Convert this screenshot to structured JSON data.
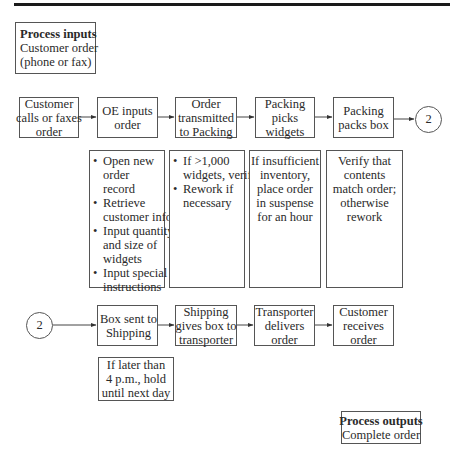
{
  "process_inputs": {
    "title": "Process inputs",
    "lines": [
      "Customer order",
      "(phone or fax)"
    ]
  },
  "top_row": [
    {
      "lines": [
        "Customer",
        "calls or faxes",
        "order"
      ]
    },
    {
      "lines": [
        "OE inputs",
        "order"
      ]
    },
    {
      "lines": [
        "Order",
        "transmitted",
        "to Packing"
      ]
    },
    {
      "lines": [
        "Packing",
        "picks",
        "widgets"
      ]
    },
    {
      "lines": [
        "Packing",
        "packs box"
      ]
    }
  ],
  "connector": {
    "label": "2"
  },
  "details": [
    {
      "bullets": [
        [
          "Open new",
          "order",
          "record"
        ],
        [
          "Retrieve",
          "customer info"
        ],
        [
          "Input quantity",
          "and size of",
          "widgets"
        ],
        [
          "Input special",
          "instructions"
        ]
      ]
    },
    {
      "bullets": [
        [
          "If >1,000",
          "widgets, verify"
        ],
        [
          "Rework if",
          "necessary"
        ]
      ]
    },
    {
      "lines": [
        "If insufficient",
        "inventory,",
        "place order",
        "in suspense",
        "for an hour"
      ]
    },
    {
      "lines": [
        "Verify that",
        "contents",
        "match order;",
        "otherwise",
        "rework"
      ]
    }
  ],
  "bottom_row": [
    {
      "lines": [
        "Box sent to",
        "Shipping"
      ]
    },
    {
      "lines": [
        "Shipping",
        "gives box to",
        "transporter"
      ]
    },
    {
      "lines": [
        "Transporter",
        "delivers",
        "order"
      ]
    },
    {
      "lines": [
        "Customer",
        "receives",
        "order"
      ]
    }
  ],
  "note": {
    "lines": [
      "If later than",
      "4 p.m., hold",
      "until next day"
    ]
  },
  "process_outputs": {
    "title": "Process outputs",
    "lines": [
      "Complete order"
    ]
  }
}
